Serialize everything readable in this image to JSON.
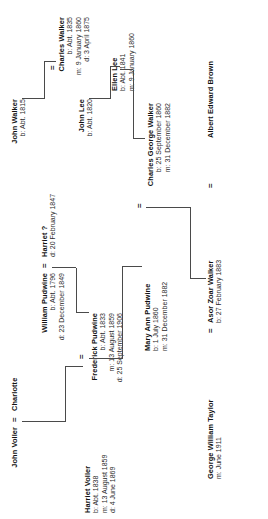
{
  "chart": {
    "type": "genealogy-tree",
    "orientation": "rotated-90-ccw",
    "line_color": "#4a4a4a",
    "text_color": "#111111",
    "background": "#ffffff",
    "marriage_symbol": "="
  },
  "people": {
    "john_voller": {
      "name": "John Voller",
      "events": []
    },
    "charlotte": {
      "name": "Charlotte",
      "events": []
    },
    "william_pudwine": {
      "name": "William Pudwine",
      "events": [
        "b: Abt. 1796",
        "d: 23 December 1849"
      ]
    },
    "harriet_q": {
      "name": "Harriet ?",
      "events": [
        "d: 20 February 1847"
      ]
    },
    "harriet_voller": {
      "name": "Harriet Voller",
      "events": [
        "b: Abt. 1838",
        "m: 13 August 1859",
        "d: 4 June 1869"
      ]
    },
    "frederick_pudwine": {
      "name": "Frederick Pudwine",
      "events": [
        "b: Abt. 1833",
        "m: 13 August 1859",
        "d: 25 September 1906"
      ]
    },
    "mary_ann_pudwine": {
      "name": "Mary Ann Pudwine",
      "events": [
        "b: 1 July 1860",
        "m: 31 December 1882"
      ]
    },
    "john_walker": {
      "name": "John Walker",
      "events": [
        "b: Abt. 1815"
      ]
    },
    "john_lee": {
      "name": "John Lee",
      "events": [
        "b: Abt. 1820"
      ]
    },
    "charles_walker": {
      "name": "Charles Walker",
      "events": [
        "b: Abt. 1835",
        "m: 9 January 1860",
        "d: 3 April 1875"
      ]
    },
    "ellen_lee": {
      "name": "Ellen Lee",
      "events": [
        "b: Abt. 1841",
        "m: 9 January 1860"
      ]
    },
    "charles_george_walker": {
      "name": "Charles George Walker",
      "events": [
        "b: 25 September 1860",
        "m: 31 December 1882"
      ]
    },
    "albert_edward_brown": {
      "name": "Albert Edward Brown",
      "events": []
    },
    "asor_zoar_walker": {
      "name": "Asor Zoar Walker",
      "events": [
        "b: 27 February 1883"
      ]
    },
    "george_william_taylor": {
      "name": "George William Taylor",
      "events": [
        "m: June 1911"
      ]
    }
  },
  "unions": [
    {
      "spouse_a": "John Voller",
      "spouse_b": "Charlotte",
      "symbol": "=",
      "child": "Harriet Voller"
    },
    {
      "spouse_a": "William Pudwine",
      "spouse_b": "Harriet ?",
      "symbol": "=",
      "child": "Frederick Pudwine"
    },
    {
      "spouse_a": "Frederick Pudwine",
      "spouse_b": "Harriet Voller",
      "symbol": "=",
      "child": "Mary Ann Pudwine"
    },
    {
      "spouse_a": "John Walker",
      "spouse_b": "",
      "symbol": "",
      "child": "Charles Walker"
    },
    {
      "spouse_a": "John Lee",
      "spouse_b": "",
      "symbol": "",
      "child": "Ellen Lee"
    },
    {
      "spouse_a": "Charles Walker",
      "spouse_b": "Ellen Lee",
      "symbol": "=",
      "child": "Charles George Walker"
    },
    {
      "spouse_a": "Charles George Walker",
      "spouse_b": "Mary Ann Pudwine",
      "symbol": "=",
      "child": "Asor Zoar Walker"
    },
    {
      "spouse_a": "Albert Edward Brown",
      "spouse_b": "Asor Zoar Walker",
      "symbol": "=",
      "child": ""
    },
    {
      "spouse_a": "Asor Zoar Walker",
      "spouse_b": "George William Taylor",
      "symbol": "=",
      "child": ""
    }
  ]
}
